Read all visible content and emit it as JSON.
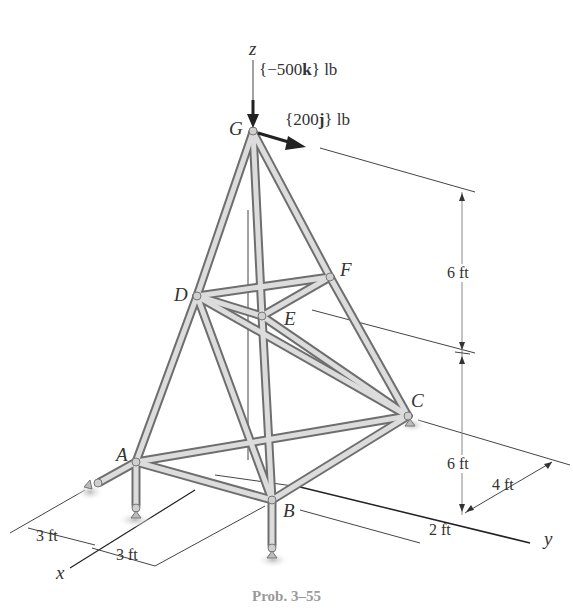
{
  "figure": {
    "caption": "Prob. 3–55",
    "axes": {
      "z": "z",
      "y": "y",
      "x": "x"
    },
    "joints": {
      "A": "A",
      "B": "B",
      "C": "C",
      "D": "D",
      "E": "E",
      "F": "F",
      "G": "G"
    },
    "loads": {
      "vertical": "{−500k} lb",
      "vertical_pre": "{−500",
      "vertical_bold": "k",
      "vertical_post": "} lb",
      "horizontal_pre": "{200",
      "horizontal_bold": "j",
      "horizontal_post": "} lb"
    },
    "dimensions": {
      "upper_height": "6 ft",
      "lower_height": "6 ft",
      "y_offset_C": "4 ft",
      "y_offset_B": "2 ft",
      "x_left": "3 ft",
      "x_right": "3 ft"
    },
    "colors": {
      "member_fill": "#d9d9d9",
      "member_edge": "#6e6e6e",
      "line": "#333333",
      "caption": "#9a9a9a"
    }
  }
}
